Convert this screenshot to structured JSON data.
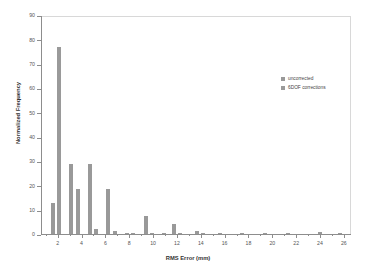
{
  "chart_data": {
    "type": "bar",
    "title": "",
    "xlabel": "RMS Error (mm)",
    "ylabel": "Normalized Frequency",
    "xlim": [
      0.6,
      26.6
    ],
    "ylim": [
      0,
      90
    ],
    "ytick_step": 10,
    "grid": false,
    "legend_position": "upper-right-inside",
    "yticks": [
      "0",
      "10",
      "20",
      "30",
      "40",
      "50",
      "60",
      "70",
      "80",
      "90"
    ],
    "xticks": [
      "2",
      "4",
      "6",
      "8",
      "10",
      "12",
      "14",
      "16",
      "18",
      "20",
      "22",
      "24",
      "26"
    ],
    "series": [
      {
        "name": "uncorrected",
        "color": "#999999",
        "points": [
          {
            "x": 1.55,
            "y": 12.8
          },
          {
            "x": 3.05,
            "y": 28.7
          },
          {
            "x": 4.6,
            "y": 28.6
          },
          {
            "x": 6.15,
            "y": 18.3
          },
          {
            "x": 7.7,
            "y": 0.4
          },
          {
            "x": 9.3,
            "y": 7.2
          },
          {
            "x": 10.8,
            "y": 0.3
          },
          {
            "x": 11.65,
            "y": 4.0
          },
          {
            "x": 13.6,
            "y": 1.3
          },
          {
            "x": 15.5,
            "y": 0.2
          },
          {
            "x": 17.4,
            "y": 0.2
          },
          {
            "x": 19.3,
            "y": 0.2
          },
          {
            "x": 21.2,
            "y": 0.2
          },
          {
            "x": 23.9,
            "y": 0.8
          },
          {
            "x": 25.6,
            "y": 0.5
          }
        ]
      },
      {
        "name": "6DOF corrections",
        "color": "#9a9a9a",
        "points": [
          {
            "x": 2.05,
            "y": 77.0
          },
          {
            "x": 3.6,
            "y": 18.5
          },
          {
            "x": 5.1,
            "y": 1.9
          },
          {
            "x": 6.7,
            "y": 1.4
          },
          {
            "x": 8.2,
            "y": 0.6
          },
          {
            "x": 9.8,
            "y": 0.3
          },
          {
            "x": 12.2,
            "y": 0.2
          },
          {
            "x": 14.1,
            "y": 0.2
          }
        ]
      }
    ]
  },
  "legend": {
    "entries": [
      {
        "label": "uncorrected",
        "color": "#999999"
      },
      {
        "label": "6DOF corrections",
        "color": "#9a9a9a"
      }
    ]
  }
}
